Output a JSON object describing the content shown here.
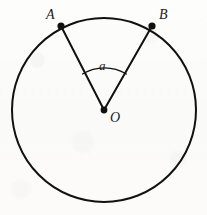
{
  "figure": {
    "kind": "circle-central-angle-diagram",
    "background_color": "#fcfcfb",
    "stroke_color": "#111111",
    "labels": {
      "point_a": "A",
      "point_b": "B",
      "center": "O",
      "angle": "a"
    },
    "geometry": {
      "center": {
        "x": 104,
        "y": 110
      },
      "radius": 92,
      "point_a": {
        "x": 61,
        "y": 26
      },
      "point_b": {
        "x": 152,
        "y": 26
      },
      "angle_arc_radius": 42,
      "circle_stroke_width": 2,
      "radius_stroke_width": 2,
      "arc_stroke_width": 1.3,
      "vertex_dot_radius": 3.6
    }
  }
}
